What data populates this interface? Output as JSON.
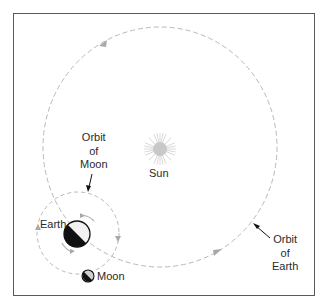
{
  "diagram": {
    "labels": {
      "sun": "Sun",
      "earth": "Earth",
      "moon": "Moon",
      "orbit_of_moon": "Orbit\nof\nMoon",
      "orbit_of_earth": "Orbit\nof\nEarth"
    },
    "colors": {
      "frame": "#5a5a5a",
      "orbit_dash": "#b8b8b8",
      "sun": "#c8c8c8",
      "earth_dark": "#111111",
      "earth_light": "#f2f2f2",
      "text": "#2a2a2a"
    }
  }
}
